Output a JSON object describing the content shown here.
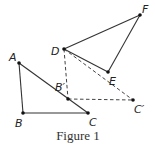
{
  "figure": {
    "caption": "Figure 1",
    "points": {
      "A": {
        "label": "A",
        "x": 19,
        "y": 63
      },
      "B": {
        "label": "B",
        "x": 23,
        "y": 113
      },
      "C": {
        "label": "C",
        "x": 88,
        "y": 113
      },
      "B_prime": {
        "label": "B′",
        "x": 68,
        "y": 99
      },
      "C_prime": {
        "label": "C′",
        "x": 133,
        "y": 100
      },
      "D": {
        "label": "D",
        "x": 64,
        "y": 49
      },
      "E": {
        "label": "E",
        "x": 108,
        "y": 72
      },
      "F": {
        "label": "F",
        "x": 140,
        "y": 15
      }
    },
    "solid_segments": [
      "AB",
      "BC",
      "AC",
      "DF",
      "DE",
      "EF"
    ],
    "dashed_segments": [
      "DB′",
      "B′C′",
      "DC′"
    ]
  }
}
